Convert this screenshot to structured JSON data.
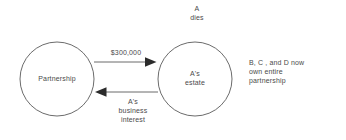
{
  "diagram": {
    "background_color": "#ffffff",
    "stroke_color": "#555555",
    "text_color": "#4a4a4a",
    "annotations": {
      "event": "A\ndies",
      "outcome_note": "B, C , and D now\nown entire\npartnership"
    },
    "nodes": [
      {
        "id": "partnership",
        "label": "Partnership",
        "shape": "circle",
        "cx": 57,
        "cy": 79,
        "r": 37
      },
      {
        "id": "as-estate",
        "label": "A's\nestate",
        "shape": "circle",
        "cx": 195,
        "cy": 79,
        "r": 37
      }
    ],
    "edges": [
      {
        "id": "cash-payment",
        "label": "$300,000",
        "from": "partnership",
        "to": "as-estate",
        "direction": "right"
      },
      {
        "id": "business-interest",
        "label": "A's\nbusiness\ninterest",
        "from": "as-estate",
        "to": "partnership",
        "direction": "left"
      }
    ]
  }
}
